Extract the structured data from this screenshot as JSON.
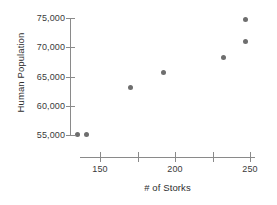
{
  "chart_data": {
    "type": "scatter",
    "title": "",
    "xlabel": "# of Storks",
    "ylabel": "Human Population",
    "xlim": [
      133,
      255
    ],
    "ylim": [
      53500,
      76200
    ],
    "grid": false,
    "legend": null,
    "x_ticks": [
      150,
      175,
      200,
      225,
      250
    ],
    "x_tick_labels": [
      "150",
      "",
      "200",
      "",
      "250"
    ],
    "y_ticks": [
      55000,
      60000,
      65000,
      70000,
      75000
    ],
    "y_tick_labels": [
      "55,000",
      "60,000",
      "65,000",
      "70,000",
      "75,000"
    ],
    "marker_color": "#6e6e6e",
    "axis_color": "#8a8a8a",
    "points": [
      {
        "x": 135,
        "y": 55100
      },
      {
        "x": 141,
        "y": 55100
      },
      {
        "x": 170,
        "y": 63050
      },
      {
        "x": 192,
        "y": 65600
      },
      {
        "x": 232,
        "y": 68300
      },
      {
        "x": 247,
        "y": 71050
      },
      {
        "x": 247,
        "y": 74800
      }
    ]
  }
}
